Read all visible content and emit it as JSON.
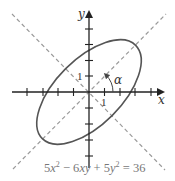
{
  "diagram": {
    "type": "rotated-ellipse-on-axes",
    "equation": {
      "text_parts": [
        "5",
        "x",
        "2",
        " − 6",
        "xy",
        " + 5",
        "y",
        "2",
        " = 36"
      ],
      "plain": "5x² − 6xy + 5y² = 36"
    },
    "axes": {
      "x_label": "x",
      "y_label": "y",
      "x_tick_label": "1",
      "y_tick_label": "1",
      "x_ticks": [
        -4,
        -3,
        -2,
        -1,
        1,
        2,
        3,
        4
      ],
      "y_ticks": [
        -4,
        -3,
        -2,
        -1,
        1,
        2,
        3,
        4
      ]
    },
    "angle_label": "α",
    "rotation_degrees": 45,
    "ellipse": {
      "semi_major": 4.243,
      "semi_minor": 2.121,
      "major_axis_direction": "y = x"
    },
    "dashed_lines": [
      "y = x",
      "y = -x"
    ],
    "colors": {
      "axes": "#222222",
      "ellipse": "#555555",
      "dashed": "#9a9a9a",
      "equation_text": "#777777"
    }
  }
}
